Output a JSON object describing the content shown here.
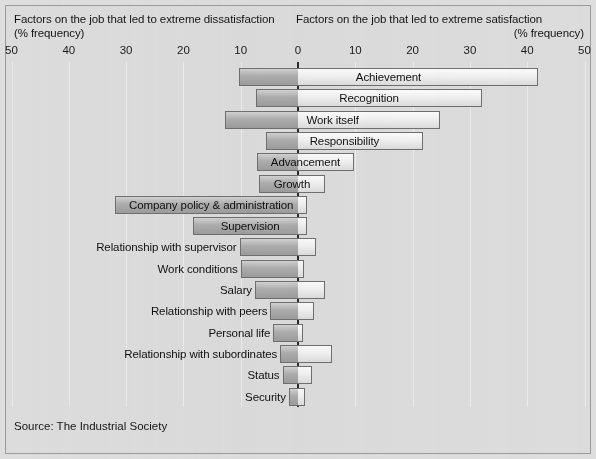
{
  "headings": {
    "left_title": "Factors on the job that led to extreme dissatisfaction",
    "left_sub": "(% frequency)",
    "right_title": "Factors on the job that led to extreme satisfaction",
    "right_sub": "(% frequency)"
  },
  "source": "Source: The Industrial Society",
  "colors": {
    "background": "#dcdcdc",
    "frame_border": "#9a9a9a",
    "gridline": "#eceaea",
    "zero_axis": "#2b2b2b",
    "bar_negative": "#adadad",
    "bar_positive": "#f0f0f0",
    "bar_border": "#6f6f6f",
    "text": "#151515"
  },
  "chart_data": {
    "type": "bar",
    "subtitle": "(% frequency)",
    "orientation": "horizontal-diverging",
    "xlabel": "% frequency",
    "ylabel": "",
    "xlim": [
      -50,
      50
    ],
    "xticks": [
      -50,
      -40,
      -30,
      -20,
      -10,
      0,
      10,
      20,
      30,
      40,
      50
    ],
    "xticklabels": [
      "50",
      "40",
      "30",
      "20",
      "10",
      "0",
      "10",
      "20",
      "30",
      "40",
      "50"
    ],
    "grid": true,
    "legend": null,
    "series": [
      {
        "name": "Dissatisfaction (% frequency)",
        "side": "left"
      },
      {
        "name": "Satisfaction (% frequency)",
        "side": "right"
      }
    ],
    "categories": [
      "Achievement",
      "Recognition",
      "Work itself",
      "Responsibility",
      "Advancement",
      "Growth",
      "Company policy & administration",
      "Supervision",
      "Relationship with supervisor",
      "Work conditions",
      "Salary",
      "Relationship with peers",
      "Personal life",
      "Relationship with subordinates",
      "Status",
      "Security"
    ],
    "dissatisfaction": [
      10.3,
      7.3,
      12.7,
      5.6,
      7.2,
      6.8,
      31.9,
      18.3,
      10.2,
      10.0,
      7.5,
      4.8,
      4.3,
      3.1,
      2.7,
      1.6
    ],
    "satisfaction": [
      41.9,
      32.1,
      24.8,
      21.8,
      9.8,
      4.7,
      1.6,
      1.6,
      3.1,
      1.0,
      4.7,
      2.8,
      0.9,
      5.9,
      2.4,
      1.2
    ],
    "label_placement": [
      "inside",
      "inside",
      "inside",
      "inside",
      "inside",
      "inside",
      "inside",
      "inside",
      "outside",
      "outside",
      "outside",
      "outside",
      "outside",
      "outside",
      "outside",
      "outside"
    ]
  }
}
